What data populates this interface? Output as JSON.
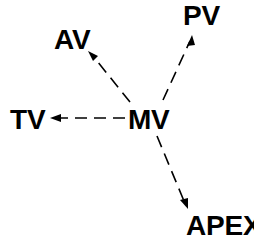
{
  "diagram": {
    "type": "radial-node-arrow-diagram",
    "background_color": "#ffffff",
    "stroke_color": "#000000",
    "text_color": "#000000",
    "center_node": {
      "id": "mv",
      "label": "MV"
    },
    "nodes": [
      {
        "id": "mv",
        "label": "MV",
        "role": "center",
        "x": 149,
        "y": 118
      },
      {
        "id": "av",
        "label": "AV",
        "role": "peripheral",
        "x": 72,
        "y": 38
      },
      {
        "id": "pv",
        "label": "PV",
        "role": "peripheral",
        "x": 200,
        "y": 15
      },
      {
        "id": "tv",
        "label": "TV",
        "role": "peripheral",
        "x": 27,
        "y": 118
      },
      {
        "id": "apex",
        "label": "APEX",
        "role": "peripheral",
        "x": 215,
        "y": 224
      }
    ],
    "edges": [
      {
        "id": "mv-av",
        "from": "mv",
        "to": "av",
        "style": "dashed",
        "arrow": "to-target",
        "direction": "upper-left",
        "x1": 130,
        "y1": 102,
        "x2": 89,
        "y2": 52
      },
      {
        "id": "mv-pv",
        "from": "mv",
        "to": "pv",
        "style": "dashed",
        "arrow": "to-target",
        "direction": "upper-right",
        "x1": 163,
        "y1": 100,
        "x2": 192,
        "y2": 36
      },
      {
        "id": "mv-tv",
        "from": "mv",
        "to": "tv",
        "style": "dashed",
        "arrow": "to-target",
        "direction": "left",
        "x1": 125,
        "y1": 118,
        "x2": 50,
        "y2": 118
      },
      {
        "id": "mv-apex",
        "from": "mv",
        "to": "apex",
        "style": "dashed",
        "arrow": "to-target",
        "direction": "lower-right",
        "x1": 157,
        "y1": 136,
        "x2": 188,
        "y2": 209
      }
    ],
    "line": {
      "stroke_width": 1.6,
      "dash_length": 12,
      "dash_gap": 7
    },
    "arrowhead": {
      "length": 11,
      "width": 6
    }
  }
}
